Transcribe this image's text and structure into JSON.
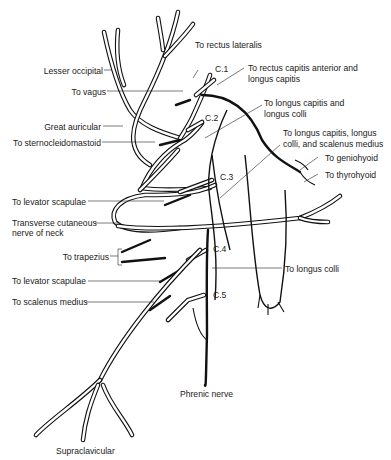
{
  "diagram": {
    "spinal_nerves": [
      "C.1",
      "C.2",
      "C.3",
      "C.4",
      "C.5"
    ],
    "labels_left": {
      "lesser_occipital": "Lesser occipital",
      "to_vagus": "To vagus",
      "great_auricular": "Great auricular",
      "to_sternocleidomastoid": "To sternocleidomastoid",
      "to_levator_scapulae_1": "To levator scapulae",
      "transverse_cutaneous_1": "Transverse cutaneous",
      "transverse_cutaneous_2": "nerve of neck",
      "to_trapezius": "To trapezius",
      "to_levator_scapulae_2": "To levator scapulae",
      "to_scalenus_medius": "To scalenus medius"
    },
    "labels_right": {
      "to_rectus_lateralis": "To rectus lateralis",
      "to_rectus_capitis_1": "To rectus capitis anterior and",
      "to_rectus_capitis_2": "longus capitis",
      "to_longus_capitis_colli_1": "To longus capitis and",
      "to_longus_capitis_colli_2": "longus colli",
      "to_longus_scalenus_1": "To longus capitis, longus",
      "to_longus_scalenus_2": "colli, and scalenus medius",
      "to_geniohyoid": "To geniohyoid",
      "to_thyrohyoid": "To thyrohyoid",
      "to_longus_colli": "To longus colli"
    },
    "labels_bottom": {
      "phrenic_nerve": "Phrenic nerve",
      "supraclavicular": "Supraclavicular"
    }
  }
}
